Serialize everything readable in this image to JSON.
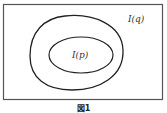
{
  "diagram": {
    "type": "set-inclusion",
    "universe_border_color": "#555555",
    "curve_color": "#222222",
    "sets": [
      {
        "id": "outer",
        "label": "I(q)"
      },
      {
        "id": "inner",
        "label": "I(p)"
      }
    ]
  },
  "caption": "図1"
}
